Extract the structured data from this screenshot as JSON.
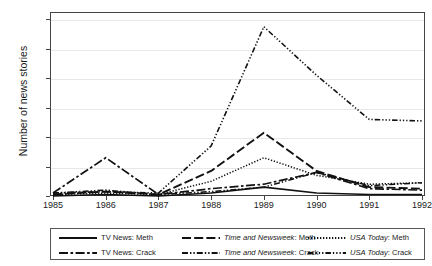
{
  "chart_data": {
    "type": "line",
    "title": "",
    "xlabel": "",
    "ylabel": "Number of news stories",
    "x": [
      1985,
      1986,
      1987,
      1988,
      1989,
      1990,
      1991,
      1992
    ],
    "xticklabels": [
      "1985",
      "1986",
      "1987",
      "1988",
      "1989",
      "1990",
      "1991",
      "1992"
    ],
    "yticklabels": [
      "0",
      "20",
      "40",
      "60",
      "80",
      "100",
      "120"
    ],
    "yticks": [
      0,
      20,
      40,
      60,
      80,
      100,
      120
    ],
    "ylim": [
      0,
      125
    ],
    "xlim": [
      1985,
      1992
    ],
    "grid": true,
    "legend_position": "below-outside",
    "series": [
      {
        "name": "TV News: Meth",
        "label_plain": "TV News: Meth",
        "dash": "solid",
        "values": [
          0,
          1,
          0,
          2,
          6,
          2,
          1,
          1
        ]
      },
      {
        "name": "TV News: Crack",
        "label_plain": "TV News: Crack",
        "dash": "dash-dot",
        "values": [
          2,
          26,
          1,
          5,
          8,
          16,
          5,
          4
        ]
      },
      {
        "name": "Time and Newsweek: Meth",
        "label_italic": "Time and Newsweek",
        "label_rest": ": Meth",
        "dash": "long-dash",
        "values": [
          1,
          3,
          1,
          17,
          43,
          17,
          6,
          5
        ]
      },
      {
        "name": "Time and Newsweek: Crack",
        "label_italic": "Time and Newsweek",
        "label_rest": ": Crack",
        "dash": "dash-dot-dot",
        "values": [
          2,
          4,
          1,
          3,
          6,
          16,
          7,
          9
        ]
      },
      {
        "name": "USA Today: Meth",
        "label_italic": "USA Today",
        "label_rest": ": Meth",
        "dash": "dotted",
        "values": [
          1,
          2,
          1,
          10,
          26,
          14,
          8,
          9
        ]
      },
      {
        "name": "USA Today: Crack",
        "label_italic": "USA Today",
        "label_rest": ": Crack",
        "dash": "dash-dot-dot-dot",
        "values": [
          2,
          3,
          2,
          34,
          115,
          82,
          52,
          51
        ]
      }
    ]
  },
  "axis": {
    "ylabel": "Number of news stories"
  },
  "legend": {
    "rows": [
      [
        {
          "italic": "",
          "plain": "TV News: Meth"
        },
        {
          "italic": "Time and Newsweek",
          "plain": ": Meth"
        },
        {
          "italic": "USA Today",
          "plain": ": Meth"
        }
      ],
      [
        {
          "italic": "",
          "plain": "TV News: Crack"
        },
        {
          "italic": "Time and Newsweek",
          "plain": ": Crack"
        },
        {
          "italic": "USA Today",
          "plain": ": Crack"
        }
      ]
    ]
  },
  "colors": {
    "line": "#111111",
    "frame": "#444444",
    "grid": "#e8e8e8",
    "background": "#ffffff"
  }
}
